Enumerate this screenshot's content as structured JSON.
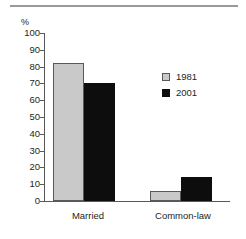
{
  "chart_data": {
    "type": "bar",
    "title": "",
    "subtitle": "",
    "xlabel": "",
    "ylabel": "%",
    "ylim": [
      0,
      100
    ],
    "ytick_step": 10,
    "yticks": [
      "100",
      "90",
      "80",
      "70",
      "60",
      "50",
      "40",
      "30",
      "20",
      "10",
      "0"
    ],
    "ytick_values": [
      100,
      90,
      80,
      70,
      60,
      50,
      40,
      30,
      20,
      10,
      0
    ],
    "grid": false,
    "legend_position": "right-inside",
    "categories": [
      "Married",
      "Common-law"
    ],
    "series": [
      {
        "name": "1981",
        "color": "#c9c9c9",
        "values": [
          82,
          6
        ]
      },
      {
        "name": "2001",
        "color": "#0d0d0d",
        "values": [
          70,
          14
        ]
      }
    ],
    "annotations": []
  },
  "figure": {
    "unit_label": "%",
    "top_rule": "horizontal-rule"
  }
}
